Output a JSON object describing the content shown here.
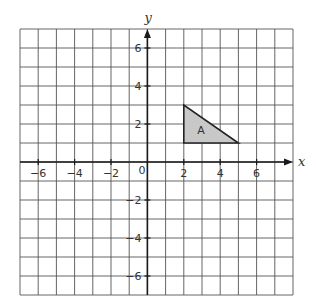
{
  "chart_data": {
    "type": "coordinate-grid",
    "title": "",
    "xlabel": "x",
    "ylabel": "y",
    "xlim": [
      -7,
      8
    ],
    "ylim": [
      -7,
      7
    ],
    "grid": true,
    "x_ticks": [
      -6,
      -4,
      -2,
      2,
      4,
      6
    ],
    "y_ticks": [
      6,
      4,
      2,
      -2,
      -4,
      -6
    ],
    "x_tick_labels": [
      "−6",
      "−4",
      "−2",
      "2",
      "4",
      "6"
    ],
    "y_tick_labels": [
      "6",
      "4",
      "2",
      "−2",
      "−4",
      "−6"
    ],
    "origin_label": "0",
    "shapes": [
      {
        "name": "A",
        "type": "triangle",
        "vertices": [
          [
            2,
            3
          ],
          [
            2,
            1
          ],
          [
            5,
            1
          ]
        ],
        "fill": "#c8c8c8",
        "stroke": "#222222"
      }
    ]
  },
  "colors": {
    "grid": "#555555",
    "axis": "#1a1a1a",
    "shape_fill": "#c8c8c8",
    "background": "#ffffff"
  }
}
